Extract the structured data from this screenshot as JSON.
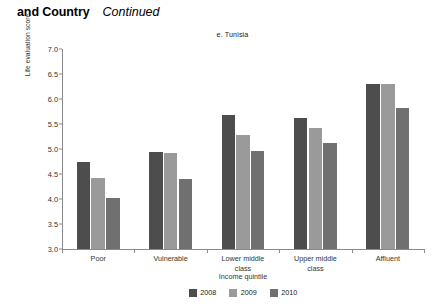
{
  "header": {
    "main": "and Country",
    "continued": "Continued"
  },
  "chart_data": {
    "type": "bar",
    "title": "e. Tunisia",
    "xlabel": "Income quintile",
    "ylabel": "Life evaluation score",
    "ylim": [
      3.0,
      7.0
    ],
    "ytick_labels": [
      "3.0",
      "3.5",
      "4.0",
      "4.5",
      "5.0",
      "5.5",
      "6.0",
      "6.5",
      "7.0"
    ],
    "ytick_values": [
      3.0,
      3.5,
      4.0,
      4.5,
      5.0,
      5.5,
      6.0,
      6.5,
      7.0
    ],
    "grid": false,
    "legend_position": "bottom",
    "categories": [
      "Poor",
      "Vulnerable",
      "Lower middle class",
      "Upper middle class",
      "Affluent"
    ],
    "category_lines": [
      [
        "Poor"
      ],
      [
        "Vulnerable"
      ],
      [
        "Lower middle",
        "class"
      ],
      [
        "Upper middle",
        "class"
      ],
      [
        "Affluent"
      ]
    ],
    "series": [
      {
        "name": "2008",
        "color": "#4d4d4d",
        "values": [
          4.75,
          4.95,
          5.68,
          5.62,
          6.3
        ]
      },
      {
        "name": "2009",
        "color": "#9a9a9a",
        "values": [
          4.42,
          4.92,
          5.28,
          5.42,
          6.3
        ]
      },
      {
        "name": "2010",
        "color": "#707070",
        "values": [
          4.02,
          4.4,
          4.97,
          5.13,
          5.83
        ]
      }
    ]
  }
}
